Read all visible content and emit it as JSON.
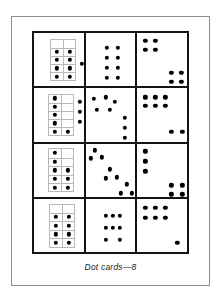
{
  "figure": {
    "caption": "Dot cards—8",
    "dot_color": "#000000",
    "card_border_color": "#141414",
    "tenframe_color": "#b9b9b9",
    "page_border_color": "#8d8d8d",
    "background": "#ffffff",
    "grid_rows": 4,
    "grid_columns": 3
  },
  "cards": [
    {
      "id": "card-r1c1",
      "row": 1,
      "column": 1,
      "type": "ten-frame-plus-loose",
      "dot_count": 9,
      "tenframe": {
        "x": 16,
        "y": 6,
        "w": 26,
        "h": 42,
        "columns": 2,
        "rows": 5,
        "filled_cells": [
          [
            2,
            1
          ],
          [
            2,
            2
          ],
          [
            3,
            1
          ],
          [
            3,
            2
          ],
          [
            4,
            1
          ],
          [
            4,
            2
          ],
          [
            5,
            1
          ],
          [
            5,
            2
          ]
        ]
      },
      "loose_dots": [
        [
          48,
          31
        ]
      ]
    },
    {
      "id": "card-r1c2",
      "row": 1,
      "column": 2,
      "type": "array",
      "dot_count": 8,
      "loose_dots": [
        [
          21,
          15
        ],
        [
          32,
          15
        ],
        [
          21,
          25
        ],
        [
          32,
          25
        ],
        [
          21,
          35
        ],
        [
          32,
          35
        ],
        [
          21,
          45
        ],
        [
          32,
          45
        ]
      ]
    },
    {
      "id": "card-r1c3",
      "row": 1,
      "column": 3,
      "type": "two-blocks",
      "dot_count": 8,
      "loose_dots": [
        [
          8,
          8
        ],
        [
          18,
          8
        ],
        [
          8,
          17
        ],
        [
          18,
          17
        ],
        [
          34,
          40
        ],
        [
          44,
          40
        ],
        [
          34,
          49
        ],
        [
          44,
          49
        ]
      ]
    },
    {
      "id": "card-r2c1",
      "row": 2,
      "column": 1,
      "type": "ten-frame-plus-loose",
      "dot_count": 9,
      "tenframe": {
        "x": 14,
        "y": 6,
        "w": 26,
        "h": 42,
        "columns": 2,
        "rows": 5,
        "filled_cells": [
          [
            1,
            1
          ],
          [
            2,
            1
          ],
          [
            3,
            1
          ],
          [
            4,
            1
          ],
          [
            5,
            1
          ],
          [
            5,
            2
          ]
        ]
      },
      "loose_dots": [
        [
          46,
          14
        ],
        [
          46,
          24
        ],
        [
          46,
          34
        ]
      ]
    },
    {
      "id": "card-r2c2",
      "row": 2,
      "column": 2,
      "type": "scatter",
      "dot_count": 8,
      "loose_dots": [
        [
          8,
          11
        ],
        [
          20,
          9
        ],
        [
          29,
          14
        ],
        [
          11,
          22
        ],
        [
          24,
          22
        ],
        [
          39,
          30
        ],
        [
          39,
          40
        ],
        [
          39,
          50
        ]
      ]
    },
    {
      "id": "card-r2c3",
      "row": 2,
      "column": 3,
      "type": "block-plus-pair",
      "dot_count": 8,
      "loose_dots": [
        [
          8,
          9
        ],
        [
          18,
          9
        ],
        [
          28,
          9
        ],
        [
          8,
          18
        ],
        [
          18,
          18
        ],
        [
          28,
          18
        ],
        [
          34,
          44
        ],
        [
          45,
          44
        ]
      ]
    },
    {
      "id": "card-r3c1",
      "row": 3,
      "column": 1,
      "type": "ten-frame",
      "dot_count": 8,
      "tenframe": {
        "x": 14,
        "y": 5,
        "w": 26,
        "h": 44,
        "columns": 2,
        "rows": 5,
        "filled_cells": [
          [
            1,
            1
          ],
          [
            2,
            1
          ],
          [
            3,
            1
          ],
          [
            3,
            2
          ],
          [
            4,
            1
          ],
          [
            4,
            2
          ],
          [
            5,
            1
          ],
          [
            5,
            2
          ]
        ]
      },
      "loose_dots": []
    },
    {
      "id": "card-r3c2",
      "row": 3,
      "column": 2,
      "type": "diagonal-clusters",
      "dot_count": 9,
      "loose_dots": [
        [
          9,
          7
        ],
        [
          5,
          15
        ],
        [
          16,
          14
        ],
        [
          24,
          26
        ],
        [
          20,
          35
        ],
        [
          31,
          34
        ],
        [
          41,
          41
        ],
        [
          35,
          50
        ],
        [
          46,
          50
        ]
      ]
    },
    {
      "id": "card-r3c3",
      "row": 3,
      "column": 3,
      "type": "line-plus-block",
      "dot_count": 7,
      "loose_dots": [
        [
          8,
          8
        ],
        [
          8,
          18
        ],
        [
          8,
          28
        ],
        [
          34,
          42
        ],
        [
          45,
          42
        ],
        [
          34,
          51
        ],
        [
          45,
          51
        ]
      ]
    },
    {
      "id": "card-r4c1",
      "row": 4,
      "column": 1,
      "type": "ten-frame",
      "dot_count": 8,
      "tenframe": {
        "x": 15,
        "y": 5,
        "w": 26,
        "h": 44,
        "columns": 2,
        "rows": 5,
        "filled_cells": [
          [
            2,
            1
          ],
          [
            2,
            2
          ],
          [
            3,
            1
          ],
          [
            3,
            2
          ],
          [
            4,
            1
          ],
          [
            4,
            2
          ],
          [
            5,
            1
          ],
          [
            5,
            2
          ]
        ]
      },
      "loose_dots": []
    },
    {
      "id": "card-r4c2",
      "row": 4,
      "column": 2,
      "type": "domino-pattern",
      "dot_count": 8,
      "loose_dots": [
        [
          20,
          17
        ],
        [
          34,
          17
        ],
        [
          20,
          29
        ],
        [
          27,
          29
        ],
        [
          34,
          29
        ],
        [
          20,
          41
        ],
        [
          34,
          41
        ],
        [
          27,
          17
        ]
      ]
    },
    {
      "id": "card-r4c3",
      "row": 4,
      "column": 3,
      "type": "block-plus-one",
      "dot_count": 7,
      "loose_dots": [
        [
          8,
          9
        ],
        [
          18,
          9
        ],
        [
          28,
          9
        ],
        [
          8,
          19
        ],
        [
          18,
          19
        ],
        [
          28,
          19
        ],
        [
          40,
          44
        ]
      ]
    }
  ]
}
